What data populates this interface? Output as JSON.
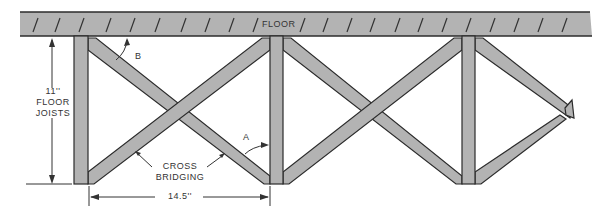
{
  "diagram": {
    "type": "floor joist cross bridging illustration",
    "floor_label": "FLOOR",
    "joist_height": {
      "value": "11''",
      "label_line1": "FLOOR",
      "label_line2": "JOISTS"
    },
    "joist_spacing": "14.5''",
    "bridging_label_line1": "CROSS",
    "bridging_label_line2": "BRIDGING",
    "angle_labels": {
      "a": "A",
      "b": "B"
    },
    "colors": {
      "member_fill": "#b3b3b3",
      "outline": "#2b2b2b",
      "text": "#333333"
    }
  }
}
